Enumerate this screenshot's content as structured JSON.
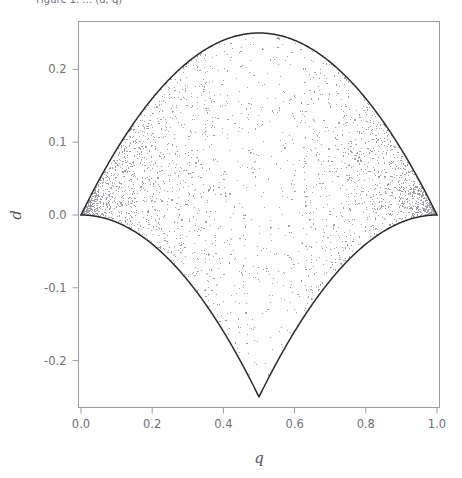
{
  "figure": {
    "caption_fragment": "Figure 1:  ...  (d, q)",
    "background_color": "#ffffff",
    "frame_color": "#9a9aa2",
    "point_color": "#a0a0a6",
    "boundary_color": "#2b2b2b"
  },
  "chart_data": {
    "type": "scatter",
    "title": "",
    "xlabel": "q",
    "ylabel": "d",
    "xlim": [
      -0.02,
      1.02
    ],
    "ylim": [
      -0.27,
      0.27
    ],
    "xticks": [
      0.0,
      0.2,
      0.4,
      0.6,
      0.8,
      1.0
    ],
    "xtick_labels": [
      "0.0",
      "0.2",
      "0.4",
      "0.6",
      "0.8",
      "1.0"
    ],
    "yticks": [
      0.2,
      0.1,
      0.0,
      -0.1,
      -0.2
    ],
    "ytick_labels": [
      "0.2",
      "0.1",
      "0.0",
      "-0.1",
      "-0.2"
    ],
    "grid": false,
    "legend": null,
    "marker": {
      "shape": "square",
      "size_px": 1.1,
      "color": "#a0a0a6"
    },
    "n_points": 14000,
    "region_description": "Admissible region of disequilibrium d as a function of allele frequency q; upper boundary d = q(1-q), lower boundary d = -q^2 for q<=0.5 and d = -(1-q)^2 for q>0.5.",
    "boundaries": [
      {
        "name": "upper-boundary",
        "formula": "d = q*(1-q)",
        "color": "#2b2b2b",
        "points": [
          [
            0.0,
            0.0
          ],
          [
            0.05,
            0.0475
          ],
          [
            0.1,
            0.09
          ],
          [
            0.15,
            0.1275
          ],
          [
            0.2,
            0.16
          ],
          [
            0.25,
            0.1875
          ],
          [
            0.3,
            0.21
          ],
          [
            0.35,
            0.2275
          ],
          [
            0.4,
            0.24
          ],
          [
            0.45,
            0.2475
          ],
          [
            0.5,
            0.25
          ],
          [
            0.55,
            0.2475
          ],
          [
            0.6,
            0.24
          ],
          [
            0.65,
            0.2275
          ],
          [
            0.7,
            0.21
          ],
          [
            0.75,
            0.1875
          ],
          [
            0.8,
            0.16
          ],
          [
            0.85,
            0.1275
          ],
          [
            0.9,
            0.09
          ],
          [
            0.95,
            0.0475
          ],
          [
            1.0,
            0.0
          ]
        ]
      },
      {
        "name": "lower-boundary",
        "formula": "d = -min(q,1-q)^2 ... cusp at (0.5,-0.25)",
        "color": "#2b2b2b",
        "points": [
          [
            0.0,
            0.0
          ],
          [
            0.05,
            -0.0025
          ],
          [
            0.1,
            -0.01
          ],
          [
            0.15,
            -0.0225
          ],
          [
            0.2,
            -0.04
          ],
          [
            0.25,
            -0.0625
          ],
          [
            0.3,
            -0.09
          ],
          [
            0.35,
            -0.1225
          ],
          [
            0.4,
            -0.16
          ],
          [
            0.45,
            -0.2025
          ],
          [
            0.5,
            -0.25
          ],
          [
            0.55,
            -0.2025
          ],
          [
            0.6,
            -0.16
          ],
          [
            0.65,
            -0.1225
          ],
          [
            0.7,
            -0.09
          ],
          [
            0.75,
            -0.0625
          ],
          [
            0.8,
            -0.04
          ],
          [
            0.85,
            -0.0225
          ],
          [
            0.9,
            -0.01
          ],
          [
            0.95,
            -0.0025
          ],
          [
            1.0,
            0.0
          ]
        ]
      }
    ],
    "key_features": [
      {
        "name": "top-apex",
        "q": 0.5,
        "d": 0.25
      },
      {
        "name": "bottom-cusp",
        "q": 0.5,
        "d": -0.25
      },
      {
        "name": "left-vertex",
        "q": 0.0,
        "d": 0.0
      },
      {
        "name": "right-vertex",
        "q": 1.0,
        "d": 0.0
      }
    ]
  }
}
